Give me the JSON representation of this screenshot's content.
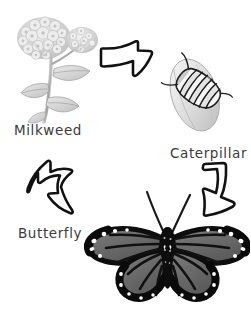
{
  "diagram": {
    "background_color": "#ffffff",
    "ink_color": "#111111",
    "label_color": "#3b3b3b",
    "width": 251,
    "height": 322
  },
  "stages": [
    {
      "id": "milkweed",
      "label": "Milkweed",
      "art": "milkweed-plant-sketch",
      "label_x": 14,
      "label_y": 122
    },
    {
      "id": "caterpillar",
      "label": "Caterpillar",
      "art": "caterpillar-sketch",
      "label_x": 170,
      "label_y": 145
    },
    {
      "id": "butterfly",
      "label": "Butterfly",
      "art": "monarch-butterfly-sketch",
      "label_x": 18,
      "label_y": 225
    }
  ],
  "arrows": [
    {
      "id": "arrow-milkweed-to-caterpillar",
      "direction": "down-right",
      "from": "milkweed",
      "to": "caterpillar"
    },
    {
      "id": "arrow-caterpillar-to-butterfly",
      "direction": "down-left",
      "from": "caterpillar",
      "to": "butterfly"
    },
    {
      "id": "arrow-butterfly-to-milkweed",
      "direction": "up-left",
      "from": "butterfly",
      "to": "milkweed"
    }
  ]
}
